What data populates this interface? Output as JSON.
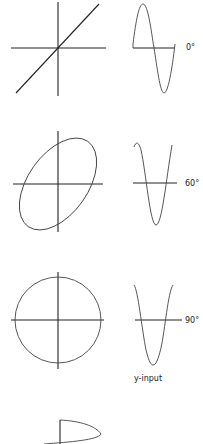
{
  "figure": {
    "rows": [
      {
        "phase_label": "0°",
        "pattern": "diagonal-line"
      },
      {
        "phase_label": "60°",
        "pattern": "ellipse"
      },
      {
        "phase_label": "90°",
        "pattern": "circle"
      }
    ],
    "waveform_caption": "y-input",
    "partial_bottom_pattern": "half-ellipse (cut off)"
  },
  "colors": {
    "line": "#222222",
    "curve": "#444444",
    "background": "#ffffff"
  }
}
